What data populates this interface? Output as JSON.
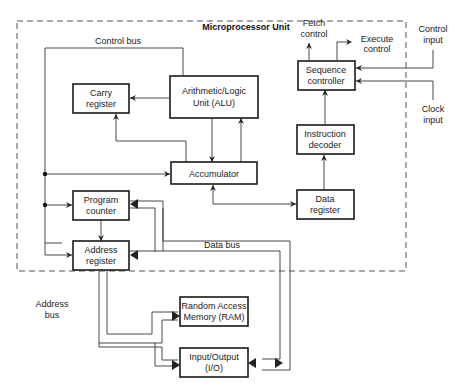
{
  "diagram": {
    "title": "Microprocessor Unit",
    "blocks": {
      "alu": {
        "line1": "Arithmetic/Logic",
        "line2": "Unit (ALU)"
      },
      "carry": {
        "line1": "Carry",
        "line2": "register"
      },
      "accumulator": {
        "line1": "Accumulator"
      },
      "program_counter": {
        "line1": "Program",
        "line2": "counter"
      },
      "address_register": {
        "line1": "Address",
        "line2": "register"
      },
      "sequence_controller": {
        "line1": "Sequence",
        "line2": "controller"
      },
      "instruction_decoder": {
        "line1": "Instruction",
        "line2": "decoder"
      },
      "data_register": {
        "line1": "Data",
        "line2": "register"
      },
      "ram": {
        "line1": "Random Access",
        "line2": "Memory (RAM)"
      },
      "io": {
        "line1": "Input/Output",
        "line2": "(I/O)"
      }
    },
    "labels": {
      "control_bus": "Control bus",
      "data_bus": "Data bus",
      "address_bus_1": "Address",
      "address_bus_2": "bus",
      "fetch_1": "Fetch",
      "fetch_2": "control",
      "execute_1": "Execute",
      "execute_2": "control",
      "control_input_1": "Control",
      "control_input_2": "input",
      "clock_input_1": "Clock",
      "clock_input_2": "input"
    }
  }
}
